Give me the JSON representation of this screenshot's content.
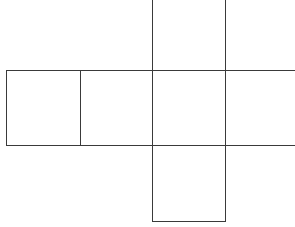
{
  "diagram": {
    "type": "cube-net",
    "stroke_color": "#3a3a3a",
    "background_color": "#ffffff",
    "cells": [
      {
        "id": "row-1",
        "x": 6,
        "y": 70,
        "w": 74,
        "h": 75
      },
      {
        "id": "row-2",
        "x": 80,
        "y": 70,
        "w": 72,
        "h": 75
      },
      {
        "id": "row-3-center",
        "x": 152,
        "y": 70,
        "w": 73,
        "h": 75
      },
      {
        "id": "row-4",
        "x": 225,
        "y": 70,
        "w": 70,
        "h": 75
      },
      {
        "id": "top",
        "x": 152,
        "y": 0,
        "w": 73,
        "h": 70
      },
      {
        "id": "bottom",
        "x": 152,
        "y": 145,
        "w": 73,
        "h": 76
      }
    ],
    "lines": {
      "horizontal": [
        {
          "name": "row-top-edge",
          "x": 6,
          "y": 70,
          "len": 289
        },
        {
          "name": "row-bottom-edge",
          "x": 6,
          "y": 145,
          "len": 289
        },
        {
          "name": "bottom-square-bottom-edge",
          "x": 152,
          "y": 221,
          "len": 74
        }
      ],
      "vertical": [
        {
          "name": "row-left-edge",
          "x": 6,
          "y": 70,
          "len": 76
        },
        {
          "name": "divider-1",
          "x": 80,
          "y": 70,
          "len": 76
        },
        {
          "name": "column-left-edge",
          "x": 152,
          "y": 0,
          "len": 222
        },
        {
          "name": "column-right-edge",
          "x": 225,
          "y": 0,
          "len": 222
        }
      ]
    }
  }
}
